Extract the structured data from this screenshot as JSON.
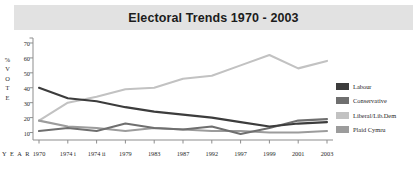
{
  "title": "Electoral Trends 1970 - 2003",
  "axes": {
    "y_caption_chars": [
      "%",
      "V",
      "O",
      "T",
      "E"
    ],
    "y_caption": "% VOTE",
    "x_caption": "Y E A R"
  },
  "legend": {
    "position": "right",
    "items": [
      {
        "label": "Labour",
        "color": "#3c3c3c"
      },
      {
        "label": "Conservative",
        "color": "#6f6f6f"
      },
      {
        "label": "Liberal/Lib.Dem",
        "color": "#c2c2c2"
      },
      {
        "label": "Plaid Cymru",
        "color": "#9c9c9c"
      }
    ]
  },
  "chart_data": {
    "type": "line",
    "title": "Electoral Trends 1970 - 2003",
    "xlabel": "YEAR",
    "ylabel": "% VOTE",
    "categories": [
      "1970",
      "1974 i",
      "1974 ii",
      "1979",
      "1983",
      "1987",
      "1992",
      "1997",
      "1999",
      "2001",
      "2003"
    ],
    "x_tick_labels": [
      "1970",
      "1974 i",
      "1974 ii",
      "1979",
      "1983",
      "1987",
      "1992",
      "1997",
      "1999",
      "2001",
      "2003"
    ],
    "y_tick_labels": [
      "10",
      "20",
      "30",
      "40",
      "50",
      "60",
      "70"
    ],
    "y_ticks": [
      10,
      20,
      30,
      40,
      50,
      60,
      70
    ],
    "ylim": [
      5,
      72
    ],
    "grid": false,
    "series": [
      {
        "name": "Labour",
        "color": "#3c3c3c",
        "values": [
          40,
          33,
          31,
          27,
          24,
          22,
          20,
          17,
          14,
          16,
          17
        ]
      },
      {
        "name": "Conservative",
        "color": "#6f6f6f",
        "values": [
          11,
          13,
          11,
          16,
          13,
          12,
          14,
          9,
          13,
          18,
          19
        ]
      },
      {
        "name": "Liberal/Lib.Dem",
        "color": "#c2c2c2",
        "values": [
          18,
          30,
          34,
          39,
          40,
          46,
          48,
          55,
          62,
          53,
          58
        ]
      },
      {
        "name": "Plaid Cymru",
        "color": "#9c9c9c",
        "values": [
          18,
          14,
          13,
          11,
          13,
          12,
          11,
          11,
          10,
          10,
          11
        ]
      }
    ]
  }
}
